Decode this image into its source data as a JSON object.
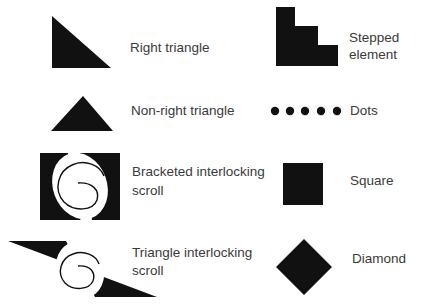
{
  "colors": {
    "fill": "#111111",
    "text": "#3a3a3a",
    "background": "#ffffff"
  },
  "left_column": [
    {
      "id": "right-triangle",
      "label": "Right triangle"
    },
    {
      "id": "non-right-triangle",
      "label": "Non-right triangle"
    },
    {
      "id": "bracketed-scroll",
      "label_line1": "Bracketed interlocking",
      "label_line2": "scroll"
    },
    {
      "id": "triangle-scroll",
      "label_line1": "Triangle interlocking",
      "label_line2": "scroll"
    }
  ],
  "right_column": [
    {
      "id": "stepped-element",
      "label_line1": "Stepped",
      "label_line2": "element"
    },
    {
      "id": "dots",
      "label": "Dots"
    },
    {
      "id": "square",
      "label": "Square"
    },
    {
      "id": "diamond",
      "label": "Diamond"
    }
  ]
}
